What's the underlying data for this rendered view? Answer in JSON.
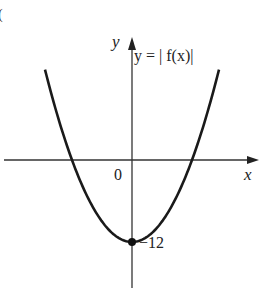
{
  "chart_data": {
    "type": "line",
    "title": "",
    "xlabel": "x",
    "ylabel": "y",
    "origin_label": "0",
    "curve_label": "y = | f(x)|",
    "annotations": [
      {
        "x": 0,
        "y": -12,
        "label": "−12",
        "marker": "dot"
      }
    ],
    "series": [
      {
        "name": "y = | f(x)|",
        "kind": "parabola",
        "vertex": [
          0,
          -12
        ],
        "roots": [
          -2,
          2
        ],
        "x": [
          -2.9,
          -2,
          0,
          2,
          2.9
        ],
        "y": [
          13.2,
          0,
          -12,
          0,
          13.2
        ]
      }
    ],
    "xlim": [
      -4.4,
      4.4
    ],
    "ylim": [
      -16.5,
      20
    ],
    "grid": false,
    "legend": "none"
  },
  "corner_mark": "("
}
